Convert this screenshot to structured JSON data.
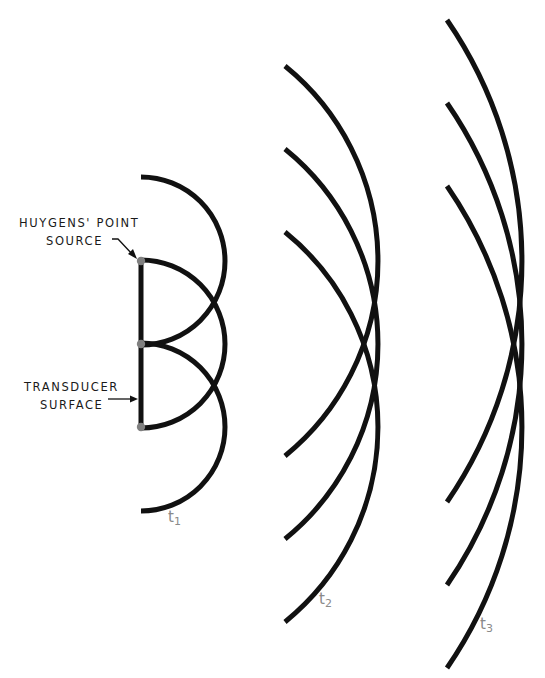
{
  "labels": {
    "point_source_line1": "HUYGENS' POINT",
    "point_source_line2": "SOURCE",
    "transducer_line1": "TRANSDUCER",
    "transducer_line2": "SURFACE"
  },
  "time_labels": [
    {
      "base": "t",
      "sub": "1"
    },
    {
      "base": "t",
      "sub": "2"
    },
    {
      "base": "t",
      "sub": "3"
    }
  ],
  "colors": {
    "stroke": "#111111",
    "source_dot": "#808080",
    "time_label": "#8a8a8a"
  },
  "geometry": {
    "transducer_x": 141,
    "source_y": [
      261,
      344,
      427
    ],
    "wavefronts": [
      {
        "name": "t1",
        "center_x": 141,
        "radius": 84
      },
      {
        "name": "t2",
        "center_x": 127,
        "radius": 251
      },
      {
        "name": "t3",
        "center_x": 97,
        "radius": 425
      }
    ]
  }
}
